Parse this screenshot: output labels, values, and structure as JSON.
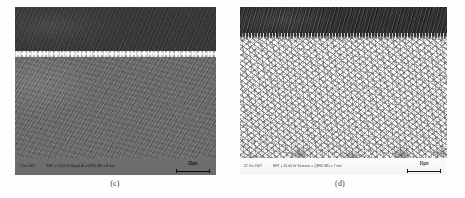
{
  "figure": {
    "kind": "sem-micrograph-pair",
    "background_color": "#ffffff"
  },
  "panels": [
    {
      "id": "c",
      "caption": "(c)",
      "description": "Cross-sectional SEM micrograph showing a dark upper coating layer separated from a lighter grey substrate by a bright interface line.",
      "regions": {
        "upper_label": "upper layer",
        "upper_color": "#3b3b3b",
        "interface_label": "bright interface line",
        "interface_color": "#f2f2f2",
        "lower_label": "substrate",
        "lower_color": "#6a6a6a"
      },
      "info_bar": {
        "theme": "on-dark",
        "date": "7 Jun 2007",
        "params": "EHT = 15.00 kV   Signal A = QBSD   WD = 8 mm",
        "scale_label": "20µm"
      }
    },
    {
      "id": "d",
      "caption": "(d)",
      "description": "SEM micrograph showing a dark band along the top edge above a bright, finely speckled polycrystalline microstructure that coarsens toward the bottom.",
      "regions": {
        "topband_label": "dark surface band",
        "topband_color": "#2a2a2a",
        "matrix_label": "bright speckled matrix",
        "matrix_color": "#f7f7f7",
        "clusters_label": "coarse dark clusters",
        "clusters_color": "#3c3c3c"
      },
      "info_bar": {
        "theme": "on-light",
        "date": "22 Oct 2007",
        "params": "EHT = 15.00 kV   Detector = QBSD   WD = 7 mm",
        "scale_label": "10µm"
      }
    }
  ]
}
